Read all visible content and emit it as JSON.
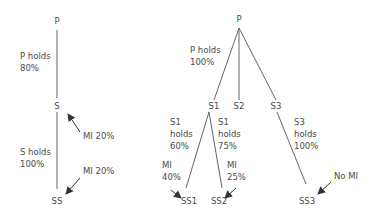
{
  "left_tree": {
    "nodes": {
      "p": "P",
      "s": "S",
      "ss": "SS"
    },
    "labels": {
      "p_holds": "P holds\n80%",
      "s_holds": "S holds\n100%",
      "mi_s": "MI 20%",
      "mi_ss": "MI 20%"
    }
  },
  "right_tree": {
    "nodes": {
      "p": "P",
      "s1": "S1",
      "s2": "S2",
      "s3": "S3",
      "ss1": "SS1",
      "ss2": "SS2",
      "ss3": "SS3"
    },
    "labels": {
      "p_holds": "P holds\n100%",
      "s1_holds_ss1": "S1\nholds\n60%",
      "s1_holds_ss2": "S1\nholds\n75%",
      "s3_holds": "S3\nholds\n100%",
      "mi_ss1": "MI\n40%",
      "mi_ss2": "MI\n25%",
      "mi_ss3": "No MI"
    }
  },
  "colors": {
    "line": "#555555",
    "text": "#4a4a4a",
    "background": "#ffffff"
  }
}
